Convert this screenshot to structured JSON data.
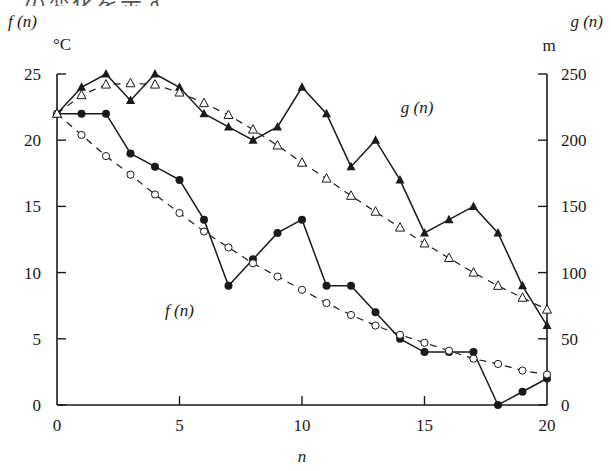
{
  "caption_fragment": "…の変化を示す。",
  "chart_data": {
    "type": "line",
    "title": "",
    "xlabel": "n",
    "x": [
      0,
      1,
      2,
      3,
      4,
      5,
      6,
      7,
      8,
      9,
      10,
      11,
      12,
      13,
      14,
      15,
      16,
      17,
      18,
      19,
      20
    ],
    "xlim": [
      0,
      20
    ],
    "xticks": [
      0,
      5,
      10,
      15,
      20
    ],
    "left_axis": {
      "label": "f (n)",
      "unit": "°C",
      "ylim": [
        0,
        25
      ],
      "ticks": [
        0,
        5,
        10,
        15,
        20,
        25
      ]
    },
    "right_axis": {
      "label": "g (n)",
      "unit": "m",
      "ylim": [
        0,
        250
      ],
      "ticks": [
        0,
        50,
        100,
        150,
        200,
        250
      ]
    },
    "grid": false,
    "legend": "inline labels",
    "annotations": [
      {
        "text": "g (n)",
        "x": 14.7,
        "y_right": 225
      },
      {
        "text": "f (n)",
        "x": 5.0,
        "y_left": 7.2
      }
    ],
    "series": [
      {
        "name": "f(n) observed",
        "axis": "left",
        "style": "solid",
        "marker": "filled-circle",
        "values": [
          22,
          22,
          22,
          19,
          18,
          17,
          14,
          9,
          11,
          13,
          14,
          9,
          9,
          7,
          5,
          4,
          4,
          4,
          0,
          1,
          2
        ]
      },
      {
        "name": "f(n) trend",
        "axis": "left",
        "style": "dashed",
        "marker": "open-circle",
        "values": [
          22,
          20.4,
          18.8,
          17.4,
          15.9,
          14.5,
          13.1,
          11.9,
          10.7,
          9.7,
          8.7,
          7.7,
          6.8,
          6.0,
          5.3,
          4.7,
          4.1,
          3.5,
          3.1,
          2.6,
          2.3
        ]
      },
      {
        "name": "g(n) observed",
        "axis": "right",
        "style": "solid",
        "marker": "filled-triangle",
        "values": [
          220,
          240,
          250,
          230,
          250,
          240,
          220,
          210,
          200,
          210,
          240,
          220,
          180,
          200,
          170,
          130,
          140,
          150,
          130,
          90,
          60
        ]
      },
      {
        "name": "g(n) trend",
        "axis": "right",
        "style": "dashed",
        "marker": "open-triangle",
        "values": [
          220,
          234,
          242,
          243,
          242,
          236,
          228,
          219,
          208,
          196,
          183,
          171,
          158,
          146,
          134,
          122,
          111,
          100,
          90,
          81,
          72
        ]
      }
    ]
  }
}
